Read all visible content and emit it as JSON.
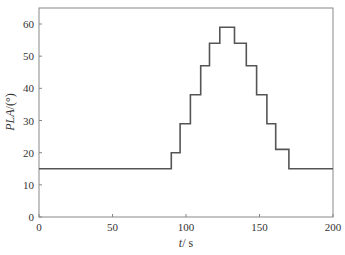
{
  "chart_data": {
    "type": "line",
    "style": "step",
    "title": "",
    "xlabel": "t / s",
    "ylabel": "PLA / (°)",
    "xlim": [
      0,
      200
    ],
    "ylim": [
      0,
      65
    ],
    "xticks": [
      0,
      50,
      100,
      150,
      200
    ],
    "yticks": [
      0,
      10,
      20,
      30,
      40,
      50,
      60
    ],
    "grid": false,
    "legend": null,
    "line_color": "#555555",
    "series": [
      {
        "name": "PLA",
        "x": [
          0,
          90,
          90,
          96,
          96,
          103,
          103,
          110,
          110,
          116,
          116,
          123,
          123,
          133,
          133,
          141,
          141,
          148,
          148,
          155,
          155,
          161,
          161,
          170,
          170,
          200
        ],
        "y": [
          15,
          15,
          20,
          20,
          29,
          29,
          38,
          38,
          47,
          47,
          54,
          54,
          59,
          59,
          54,
          54,
          47,
          47,
          38,
          38,
          29,
          29,
          21,
          21,
          15,
          15
        ]
      }
    ],
    "steps": [
      {
        "t_start": 0,
        "t_end": 90,
        "value": 15
      },
      {
        "t_start": 90,
        "t_end": 96,
        "value": 20
      },
      {
        "t_start": 96,
        "t_end": 103,
        "value": 29
      },
      {
        "t_start": 103,
        "t_end": 110,
        "value": 38
      },
      {
        "t_start": 110,
        "t_end": 116,
        "value": 47
      },
      {
        "t_start": 116,
        "t_end": 123,
        "value": 54
      },
      {
        "t_start": 123,
        "t_end": 133,
        "value": 59
      },
      {
        "t_start": 133,
        "t_end": 141,
        "value": 54
      },
      {
        "t_start": 141,
        "t_end": 148,
        "value": 47
      },
      {
        "t_start": 148,
        "t_end": 155,
        "value": 38
      },
      {
        "t_start": 155,
        "t_end": 161,
        "value": 29
      },
      {
        "t_start": 161,
        "t_end": 170,
        "value": 21
      },
      {
        "t_start": 170,
        "t_end": 200,
        "value": 15
      }
    ]
  },
  "labels": {
    "x_axis_var": "t",
    "x_axis_unit": "/ s",
    "y_axis_var": "PLA",
    "y_axis_unit": "/(°)"
  }
}
